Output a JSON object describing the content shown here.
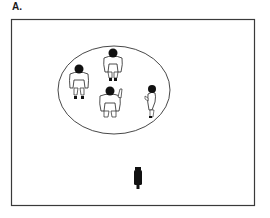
{
  "panel": {
    "label": "A."
  },
  "scene": {
    "frame": {
      "x": 11,
      "y": 19,
      "width": 243,
      "height": 186,
      "stroke": "#3a3a3a"
    },
    "group_ellipse": {
      "cx": 114,
      "cy": 90,
      "rx": 56,
      "ry": 44,
      "stroke": "#333333"
    },
    "people": [
      {
        "name": "person-left",
        "x": 79,
        "y": 82
      },
      {
        "name": "person-top",
        "x": 113,
        "y": 64
      },
      {
        "name": "person-center-waving",
        "x": 110,
        "y": 101
      },
      {
        "name": "person-right-small",
        "x": 152,
        "y": 98
      }
    ],
    "camera": {
      "x": 138,
      "y": 177
    }
  }
}
